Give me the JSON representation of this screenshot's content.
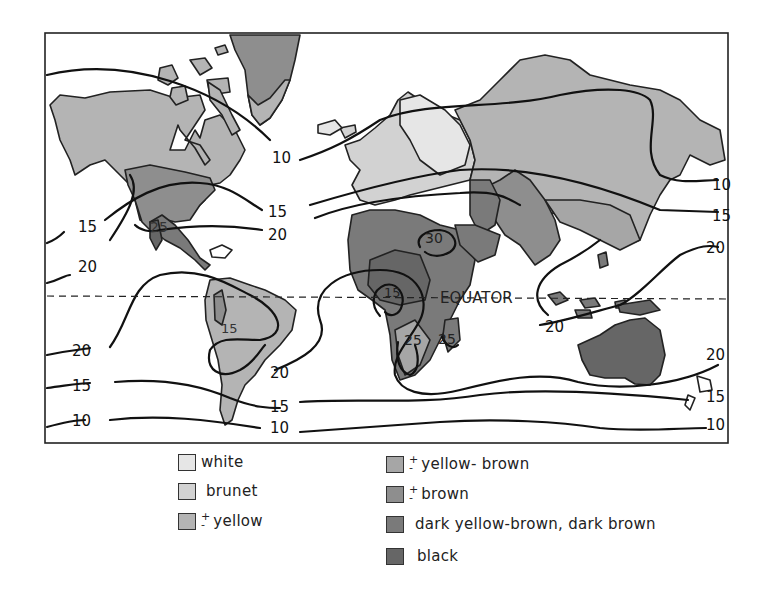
{
  "map": {
    "equator_label": "EQUATOR",
    "isoline_labels": {
      "left": [
        "15",
        "20",
        "20",
        "15",
        "10"
      ],
      "right": [
        "10",
        "15",
        "20",
        "20",
        "15",
        "10"
      ],
      "inner": [
        "10",
        "15",
        "20",
        "25",
        "30",
        "15",
        "15",
        "25",
        "25",
        "20",
        "20",
        "15",
        "10"
      ]
    },
    "colors": {
      "white": "#e6e6e6",
      "brunet": "#d2d2d2",
      "yellow": "#b4b4b4",
      "yellow_brown": "#a6a6a6",
      "brown": "#8e8e8e",
      "dark": "#7a7a7a",
      "black": "#666666"
    }
  },
  "legend": {
    "left": [
      {
        "label": "white",
        "pm": false,
        "color": "#e6e6e6"
      },
      {
        "label": "brunet",
        "pm": false,
        "color": "#d2d2d2"
      },
      {
        "label": "yellow",
        "pm": true,
        "color": "#b4b4b4"
      }
    ],
    "right": [
      {
        "label": "yellow- brown",
        "pm": true,
        "color": "#a6a6a6"
      },
      {
        "label": "brown",
        "pm": true,
        "color": "#8e8e8e"
      },
      {
        "label": "dark yellow-brown, dark brown",
        "pm": false,
        "color": "#7a7a7a"
      },
      {
        "label": "black",
        "pm": false,
        "color": "#666666"
      }
    ],
    "pm_symbol": {
      "plus": "+",
      "minus": "-"
    }
  }
}
